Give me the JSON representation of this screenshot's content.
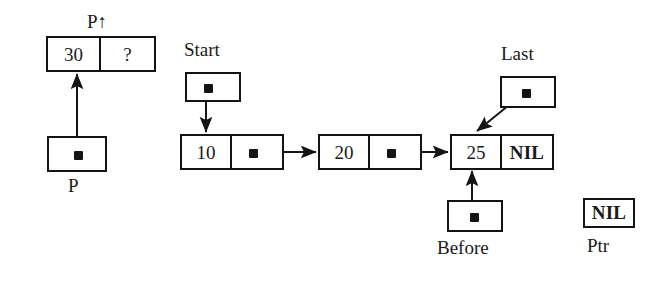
{
  "diagram": {
    "background": "#ffffff",
    "ink": "#141414"
  },
  "new_node": {
    "label": "P↑",
    "data_value": "30",
    "link_value": "?"
  },
  "pointers": {
    "p": {
      "label": "P",
      "target": "new-node"
    },
    "start": {
      "label": "Start",
      "target": "node-10"
    },
    "last": {
      "label": "Last",
      "target": "node-25"
    },
    "before": {
      "label": "Before",
      "target": "node-25"
    },
    "ptr": {
      "label": "Ptr",
      "value": "NIL"
    }
  },
  "list_nodes": [
    {
      "data_value": "10",
      "link_kind": "dot",
      "link_value": ""
    },
    {
      "data_value": "20",
      "link_kind": "dot",
      "link_value": ""
    },
    {
      "data_value": "25",
      "link_kind": "nil",
      "link_value": "NIL"
    }
  ],
  "icons": {
    "pointer_dot": "filled-square-pointer-icon",
    "arrowhead": "arrowhead-icon"
  }
}
